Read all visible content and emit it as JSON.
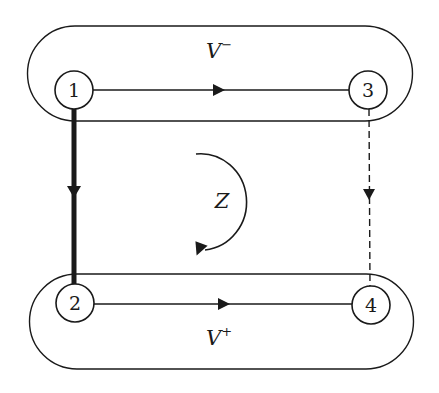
{
  "diagram": {
    "groups": [
      {
        "id": "v-minus",
        "label": "V",
        "superscript": "−"
      },
      {
        "id": "v-plus",
        "label": "V",
        "superscript": "+"
      }
    ],
    "nodes": [
      {
        "id": "1",
        "label": "1"
      },
      {
        "id": "2",
        "label": "2"
      },
      {
        "id": "3",
        "label": "3"
      },
      {
        "id": "4",
        "label": "4"
      }
    ],
    "edges": [
      {
        "from": "1",
        "to": "3",
        "style": "solid"
      },
      {
        "from": "2",
        "to": "4",
        "style": "solid"
      },
      {
        "from": "1",
        "to": "2",
        "style": "thick"
      },
      {
        "from": "3",
        "to": "4",
        "style": "dashed"
      }
    ],
    "center_label": "Z",
    "rotation": "clockwise",
    "colors": {
      "stroke": "#1a1a1a",
      "background": "#ffffff"
    }
  }
}
